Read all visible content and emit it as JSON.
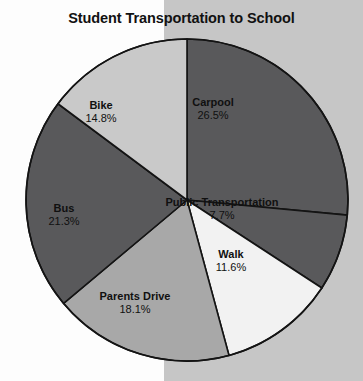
{
  "chart_data": {
    "type": "pie",
    "title": "Student Transportation to School",
    "categories": [
      "Carpool",
      "Public Transportation",
      "Walk",
      "Parents Drive",
      "Bus",
      "Bike"
    ],
    "values": [
      26.5,
      7.7,
      11.6,
      18.1,
      21.3,
      14.8
    ],
    "value_suffix": "%",
    "start_angle_deg": 0,
    "direction": "clockwise",
    "legend": "none",
    "grid": false,
    "labels_inside": true,
    "slices": [
      {
        "name": "Carpool",
        "value": 26.5,
        "value_text": "26.5%",
        "color": "#59595b",
        "label_x": 213,
        "label_y": 96
      },
      {
        "name": "Public Transportation",
        "value": 7.7,
        "value_text": "7.7%",
        "color": "#59595b",
        "label_x": 222,
        "label_y": 196
      },
      {
        "name": "Walk",
        "value": 11.6,
        "value_text": "11.6%",
        "color": "#f2f2f2",
        "label_x": 231,
        "label_y": 248
      },
      {
        "name": "Parents Drive",
        "value": 18.1,
        "value_text": "18.1%",
        "color": "#a8a8a8",
        "label_x": 135,
        "label_y": 290
      },
      {
        "name": "Bus",
        "value": 21.3,
        "value_text": "21.3%",
        "color": "#59595b",
        "label_x": 64,
        "label_y": 202
      },
      {
        "name": "Bike",
        "value": 14.8,
        "value_text": "14.8%",
        "color": "#c9c9c9",
        "label_x": 101,
        "label_y": 99
      }
    ],
    "geometry": {
      "cx": 187,
      "cy": 200,
      "r": 161,
      "stroke": "#141414",
      "stroke_width": 1.6
    }
  },
  "background": {
    "left_color": "#fdfdfd",
    "right_color": "#c6c6c6",
    "split_x": 164
  }
}
